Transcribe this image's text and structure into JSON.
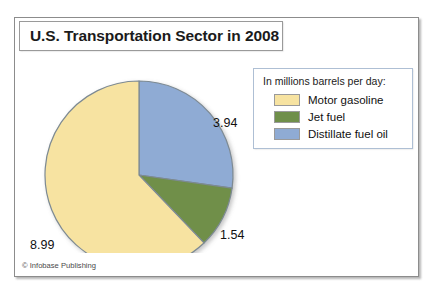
{
  "figure": {
    "title": "U.S. Transportation Sector in 2008",
    "credit": "© Infobase Publishing"
  },
  "legend": {
    "title": "In millions barrels per day:",
    "items": [
      {
        "label": "Motor gasoline",
        "color": "#f7e3a1",
        "swatch_name": "legend-swatch-motor-gasoline"
      },
      {
        "label": "Jet fuel",
        "color": "#6f8f4a",
        "swatch_name": "legend-swatch-jet-fuel"
      },
      {
        "label": "Distillate fuel oil",
        "color": "#8fabd4",
        "swatch_name": "legend-swatch-distillate-fuel-oil"
      }
    ]
  },
  "labels": {
    "distillate": "3.94",
    "jet": "1.54",
    "gasoline": "8.99"
  },
  "chart_data": {
    "type": "pie",
    "title": "U.S. Transportation Sector in 2008",
    "subtitle": "In millions barrels per day:",
    "unit": "million barrels per day",
    "total": 14.47,
    "categories": [
      "Distillate fuel oil",
      "Jet fuel",
      "Motor gasoline"
    ],
    "values": [
      3.94,
      1.54,
      8.99
    ],
    "colors": [
      "#8fabd4",
      "#6f8f4a",
      "#f7e3a1"
    ],
    "slices": [
      {
        "label": "Distillate fuel oil",
        "value": 3.94,
        "color": "#8fabd4",
        "percent": 27.2,
        "start_angle": 0.0,
        "end_angle": 98.0,
        "label_text": "3.94"
      },
      {
        "label": "Jet fuel",
        "value": 1.54,
        "color": "#6f8f4a",
        "percent": 10.6,
        "start_angle": 98.0,
        "end_angle": 136.3,
        "label_text": "1.54"
      },
      {
        "label": "Motor gasoline",
        "value": 8.99,
        "color": "#f7e3a1",
        "percent": 62.1,
        "start_angle": 136.3,
        "end_angle": 360.0,
        "label_text": "8.99"
      }
    ],
    "start_angle_deg": 0,
    "direction": "clockwise",
    "legend_position": "right",
    "grid": false,
    "xlabel": "",
    "ylabel": ""
  }
}
